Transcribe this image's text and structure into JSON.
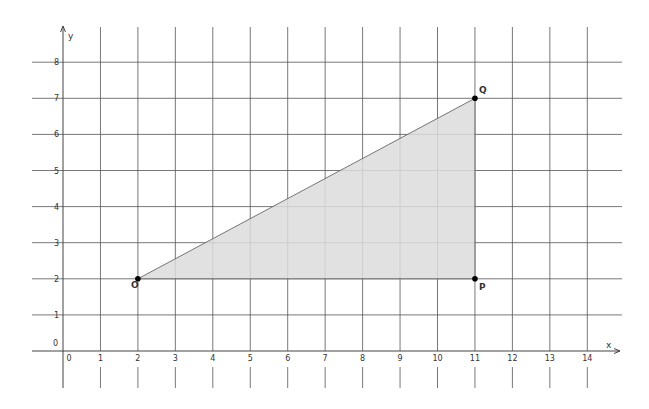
{
  "chart_data": {
    "type": "diagram",
    "title": "",
    "xlabel": "x",
    "ylabel": "y",
    "xlim": [
      0,
      14
    ],
    "ylim": [
      0,
      8
    ],
    "grid": true,
    "x_ticks": [
      "0",
      "1",
      "2",
      "3",
      "4",
      "5",
      "6",
      "7",
      "8",
      "9",
      "10",
      "11",
      "12",
      "13",
      "14"
    ],
    "y_ticks": [
      "0",
      "1",
      "2",
      "3",
      "4",
      "5",
      "6",
      "7",
      "8"
    ],
    "points": [
      {
        "label": "O",
        "x": 2,
        "y": 2
      },
      {
        "label": "P",
        "x": 11,
        "y": 2
      },
      {
        "label": "Q",
        "x": 11,
        "y": 7
      }
    ],
    "polygon": {
      "vertices": [
        "O",
        "P",
        "Q"
      ],
      "fill": "#dcdcdc",
      "stroke": "#666666"
    }
  },
  "colors": {
    "grid": "#555555",
    "axis": "#444444",
    "fill": "#dcdcdc",
    "point": "#000000"
  }
}
